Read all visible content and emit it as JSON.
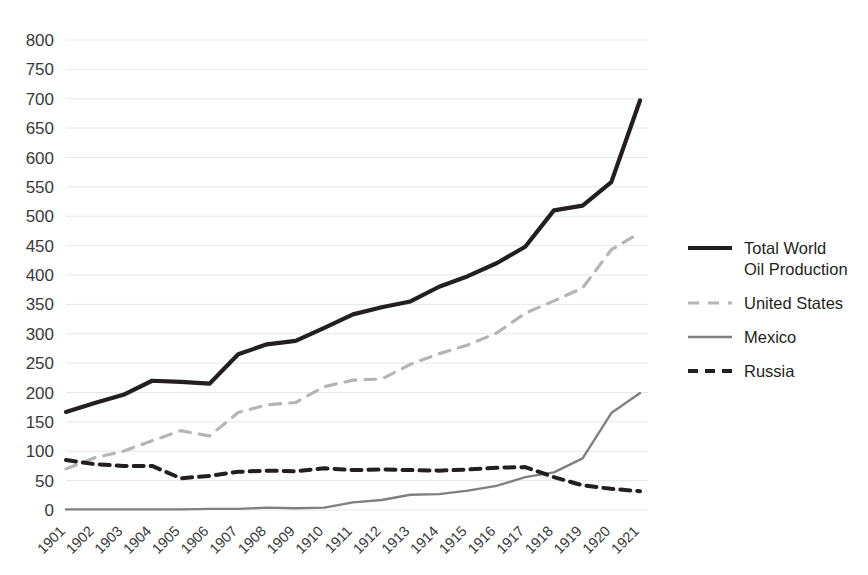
{
  "chart_data": {
    "type": "line",
    "title": "",
    "xlabel": "",
    "ylabel": "",
    "ylim": [
      0,
      800
    ],
    "ytick_step": 50,
    "grid": true,
    "legend_position": "right",
    "categories": [
      "1901",
      "1902",
      "1903",
      "1904",
      "1905",
      "1906",
      "1907",
      "1908",
      "1909",
      "1910",
      "1911",
      "1912",
      "1913",
      "1914",
      "1915",
      "1916",
      "1917",
      "1918",
      "1919",
      "1920",
      "1921"
    ],
    "yticks": [
      "0",
      "50",
      "100",
      "150",
      "200",
      "250",
      "300",
      "350",
      "400",
      "450",
      "500",
      "550",
      "600",
      "650",
      "700",
      "750",
      "800"
    ],
    "series": [
      {
        "name": "Total World Oil Production",
        "style": "solid-thick",
        "color": "#231f20",
        "width": 4.2,
        "values": [
          167,
          182,
          196,
          220,
          218,
          215,
          265,
          282,
          288,
          310,
          333,
          345,
          355,
          380,
          398,
          420,
          448,
          510,
          518,
          558,
          697
        ]
      },
      {
        "name": "United States",
        "style": "dashed-light",
        "color": "#b5b5b5",
        "width": 3.2,
        "values": [
          70,
          89,
          100,
          118,
          135,
          126,
          166,
          179,
          183,
          210,
          221,
          223,
          248,
          266,
          281,
          301,
          335,
          356,
          378,
          443,
          472
        ]
      },
      {
        "name": "Mexico",
        "style": "solid-thin",
        "color": "#808080",
        "width": 2.4,
        "values": [
          1,
          1,
          1,
          1,
          1,
          2,
          2,
          4,
          3,
          4,
          13,
          17,
          26,
          27,
          33,
          41,
          56,
          64,
          88,
          165,
          199
        ]
      },
      {
        "name": "Russia",
        "style": "dashed-dark",
        "color": "#231f20",
        "width": 4.0,
        "values": [
          85,
          78,
          75,
          75,
          54,
          58,
          65,
          67,
          66,
          71,
          68,
          69,
          68,
          67,
          69,
          72,
          73,
          56,
          42,
          36,
          32
        ]
      }
    ]
  },
  "legend": {
    "entries": [
      {
        "label_line1": "Total World",
        "label_line2": "Oil Production"
      },
      {
        "label_line1": "United States",
        "label_line2": ""
      },
      {
        "label_line1": "Mexico",
        "label_line2": ""
      },
      {
        "label_line1": "Russia",
        "label_line2": ""
      }
    ]
  }
}
